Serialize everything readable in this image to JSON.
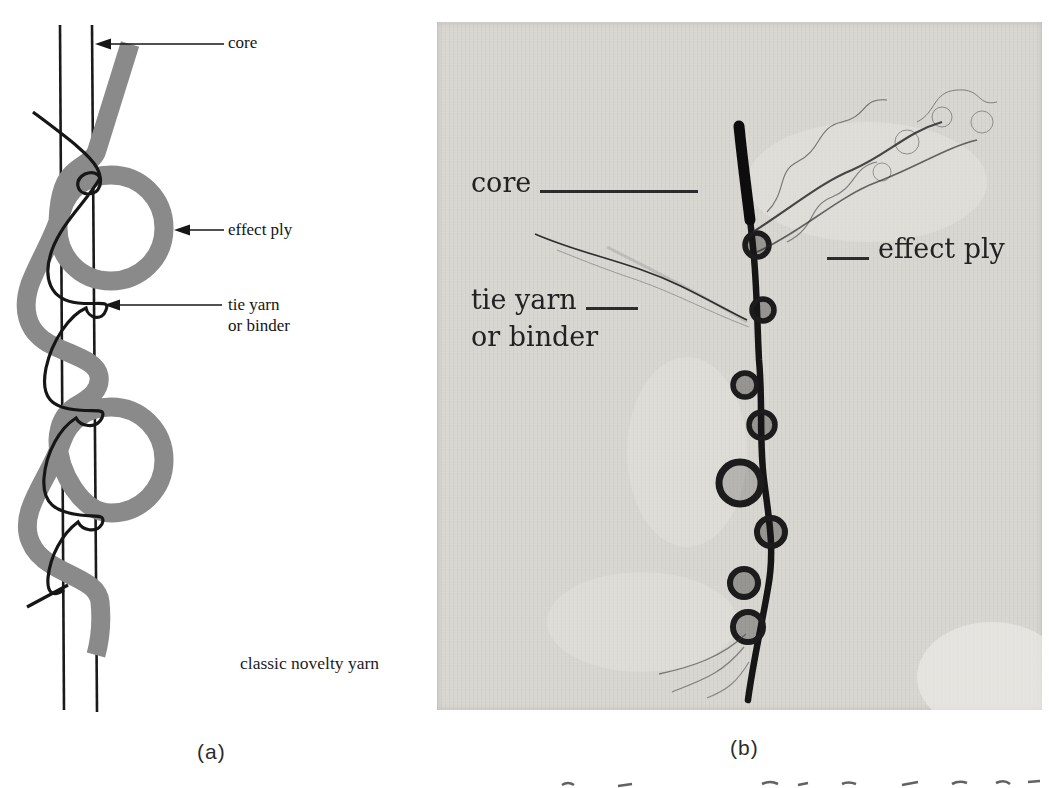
{
  "figure": {
    "panel_a": {
      "caption": "(a)",
      "footer_label": "classic novelty yarn",
      "label_core": "core",
      "label_effect_ply": "effect ply",
      "label_tie_yarn_line1": "tie yarn",
      "label_tie_yarn_line2": "or binder"
    },
    "panel_b": {
      "caption": "(b)",
      "label_core": "core",
      "label_effect_ply": "effect ply",
      "label_tie_yarn_line1": "tie yarn",
      "label_tie_yarn_line2": "or binder"
    },
    "colors": {
      "effect_ply_gray": "#8a8a8a",
      "diagram_line": "#1a1a1a",
      "photo_background": "#d8d6d1",
      "photo_label_text": "#222222"
    }
  }
}
